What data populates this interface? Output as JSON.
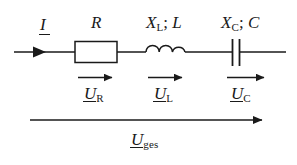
{
  "diagram": {
    "type": "electrical-schematic",
    "background_color": "#ffffff",
    "line_color": "#1a1a1a",
    "text_color": "#1a1a1a"
  },
  "component_labels": {
    "current": {
      "symbol": "I",
      "subscript": "",
      "underlined": true
    },
    "resistor": {
      "symbol": "R",
      "subscript": "",
      "underlined": false
    },
    "inductor": {
      "symbol": "X",
      "subscript": "L",
      "separator": "; ",
      "second_symbol": "L",
      "full": "XL; L",
      "underlined": false
    },
    "capacitor": {
      "symbol": "X",
      "subscript": "C",
      "separator": "; ",
      "second_symbol": "C",
      "full": "XC; C",
      "underlined": false
    }
  },
  "voltage_labels": {
    "resistor_voltage": {
      "symbol": "U",
      "subscript": "R",
      "underlined": true
    },
    "inductor_voltage": {
      "symbol": "U",
      "subscript": "L",
      "underlined": true
    },
    "capacitor_voltage": {
      "symbol": "U",
      "subscript": "C",
      "underlined": true
    },
    "total_voltage": {
      "symbol": "U",
      "subscript": "ges",
      "underlined": true
    }
  },
  "elements": {
    "main_wire": "horizontal conductor line",
    "current_arrow": "arrowhead on main wire pointing right",
    "resistor_box": "rectangle",
    "inductor_coil": "three semicircular arcs",
    "capacitor_plates": "two parallel vertical plates",
    "voltage_arrows": "three short right-pointing arrows",
    "total_voltage_arrow": "long right-pointing arrow"
  }
}
